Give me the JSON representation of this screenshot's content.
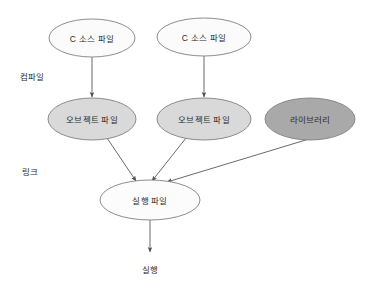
{
  "diagram": {
    "colors": {
      "source_fill": "#fbfbfb",
      "object_fill": "#d9d9d9",
      "library_fill": "#a9a9a9",
      "executable_fill": "#fcfcfc",
      "stroke": "#808080",
      "arrow": "#595959",
      "text": "#2b2b2b",
      "background": "#ffffff"
    },
    "nodes": [
      {
        "id": "source1",
        "label": "C 소스 파일",
        "shape": "ellipse",
        "fill": "#fbfbfb",
        "cx": 92,
        "cy": 38,
        "rx": 43,
        "ry": 19
      },
      {
        "id": "source2",
        "label": "C 소스 파일",
        "shape": "ellipse",
        "fill": "#fbfbfb",
        "cx": 204,
        "cy": 37,
        "rx": 47,
        "ry": 19
      },
      {
        "id": "object1",
        "label": "오브젝트 파일",
        "shape": "ellipse",
        "fill": "#d9d9d9",
        "cx": 92,
        "cy": 119,
        "rx": 44,
        "ry": 21
      },
      {
        "id": "object2",
        "label": "오브젝트 파일",
        "shape": "ellipse",
        "fill": "#d9d9d9",
        "cx": 204,
        "cy": 119,
        "rx": 47,
        "ry": 21
      },
      {
        "id": "library",
        "label": "라이브러리",
        "shape": "ellipse",
        "fill": "#a9a9a9",
        "cx": 310,
        "cy": 119,
        "rx": 45,
        "ry": 21
      },
      {
        "id": "executable",
        "label": "실행 파일",
        "shape": "ellipse",
        "fill": "#fcfcfc",
        "cx": 150,
        "cy": 200,
        "rx": 50,
        "ry": 20
      }
    ],
    "stage_labels": [
      {
        "id": "compile",
        "label": "컴파일",
        "x": 20,
        "y": 70
      },
      {
        "id": "link",
        "label": "링크",
        "x": 22,
        "y": 165
      }
    ],
    "terminal_labels": [
      {
        "id": "run",
        "label": "실행",
        "x": 150,
        "y": 263
      }
    ],
    "edges": [
      {
        "id": "edge-source1-object1",
        "from": "source1",
        "to": "object1",
        "x1": 92,
        "y1": 57,
        "x2": 92,
        "y2": 97
      },
      {
        "id": "edge-source2-object2",
        "from": "source2",
        "to": "object2",
        "x1": 204,
        "y1": 56,
        "x2": 204,
        "y2": 97
      },
      {
        "id": "edge-object1-executable",
        "from": "object1",
        "to": "executable",
        "x1": 107,
        "y1": 138,
        "x2": 136,
        "y2": 181
      },
      {
        "id": "edge-object2-executable",
        "from": "object2",
        "to": "executable",
        "x1": 186,
        "y1": 138,
        "x2": 152,
        "y2": 181
      },
      {
        "id": "edge-library-executable",
        "from": "library",
        "to": "executable",
        "x1": 309,
        "y1": 139,
        "x2": 167,
        "y2": 182
      },
      {
        "id": "edge-executable-run",
        "from": "executable",
        "to": "run",
        "x1": 150,
        "y1": 220,
        "x2": 150,
        "y2": 252
      }
    ]
  }
}
